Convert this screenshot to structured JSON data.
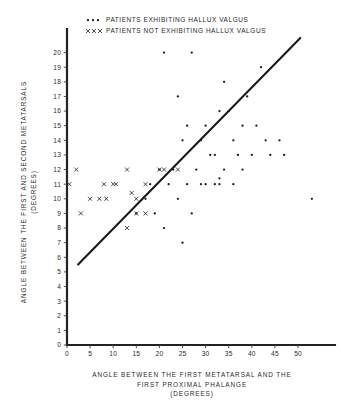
{
  "figure": {
    "background": "#ffffff",
    "ink_color": "#1b1b1b"
  },
  "legend": {
    "position": "top-center",
    "entries": [
      {
        "marker": "dot",
        "marker_glyph": "• • •",
        "label": "PATIENTS EXHIBITING HALLUX VALGUS"
      },
      {
        "marker": "cross",
        "marker_glyph": "x x x",
        "label": "PATIENTS NOT EXHIBITING HALLUX VALGUS"
      }
    ]
  },
  "chart_data": {
    "type": "scatter",
    "title": "",
    "xlabel": "ANGLE BETWEEN THE FIRST METATARSAL AND THE FIRST PROXIMAL PHALANGE (DEGREES)",
    "xlabel_lines": [
      "ANGLE BETWEEN THE FIRST METATARSAL AND THE",
      "FIRST PROXIMAL PHALANGE",
      "(DEGREES)"
    ],
    "ylabel": "ANGLE BETWEEN THE FIRST AND SECOND METATARSALS (DEGREES)",
    "ylabel_lines": [
      "ANGLE BETWEEN THE FIRST AND SECOND METATARSALS",
      "(DEGREES)"
    ],
    "xlim": [
      0,
      58
    ],
    "ylim": [
      0,
      21
    ],
    "xticks": [
      0,
      5,
      10,
      15,
      20,
      25,
      30,
      35,
      40,
      45,
      50
    ],
    "yticks": [
      0,
      1,
      2,
      3,
      4,
      5,
      6,
      7,
      8,
      9,
      10,
      11,
      12,
      13,
      14,
      15,
      16,
      17,
      18,
      19,
      20
    ],
    "grid": false,
    "legend_position": "top-center",
    "series": [
      {
        "name": "PATIENTS EXHIBITING HALLUX VALGUS",
        "marker": "dot",
        "points": [
          [
            21,
            20
          ],
          [
            27,
            20
          ],
          [
            42,
            19
          ],
          [
            34,
            18
          ],
          [
            39,
            17
          ],
          [
            24,
            17
          ],
          [
            33,
            16
          ],
          [
            35,
            16
          ],
          [
            26,
            15
          ],
          [
            30,
            15
          ],
          [
            38,
            15
          ],
          [
            41,
            15
          ],
          [
            25,
            14
          ],
          [
            29,
            14
          ],
          [
            36,
            14
          ],
          [
            43,
            14
          ],
          [
            46,
            14
          ],
          [
            31,
            13
          ],
          [
            32,
            13
          ],
          [
            37,
            13
          ],
          [
            40,
            13
          ],
          [
            44,
            13
          ],
          [
            47,
            13
          ],
          [
            28,
            12
          ],
          [
            34,
            12
          ],
          [
            38,
            12
          ],
          [
            33,
            11
          ],
          [
            33,
            11.4
          ],
          [
            36,
            11
          ],
          [
            20,
            12
          ],
          [
            23,
            12
          ],
          [
            18,
            11
          ],
          [
            22,
            11
          ],
          [
            26,
            11
          ],
          [
            29,
            11
          ],
          [
            30,
            11
          ],
          [
            32,
            11
          ],
          [
            17,
            10
          ],
          [
            24,
            10
          ],
          [
            19,
            9
          ],
          [
            27,
            9
          ],
          [
            15,
            9
          ],
          [
            21,
            8
          ],
          [
            25,
            7
          ],
          [
            53,
            10
          ]
        ]
      },
      {
        "name": "PATIENTS NOT EXHIBITING HALLUX VALGUS",
        "marker": "cross",
        "points": [
          [
            2,
            12
          ],
          [
            13,
            12
          ],
          [
            20,
            12
          ],
          [
            0.5,
            11
          ],
          [
            8,
            11
          ],
          [
            10,
            11
          ],
          [
            10.6,
            11
          ],
          [
            17,
            11
          ],
          [
            5,
            10
          ],
          [
            7,
            10
          ],
          [
            8.5,
            10
          ],
          [
            15,
            10
          ],
          [
            14,
            10.4
          ],
          [
            3,
            9
          ],
          [
            15,
            9
          ],
          [
            17,
            9
          ],
          [
            13,
            8
          ],
          [
            21,
            12
          ],
          [
            24,
            12
          ]
        ]
      }
    ],
    "fit_line": {
      "label": "regression line",
      "x_start": 2.4,
      "y_start": 5.5,
      "x_end": 50.5,
      "y_end": 21
    }
  }
}
